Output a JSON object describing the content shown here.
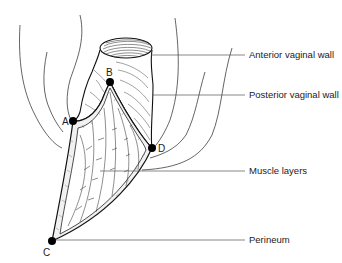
{
  "figure": {
    "type": "anatomical-diagram",
    "background": "#ffffff",
    "ink_color": "#111111",
    "leader_color": "#555555"
  },
  "labels": {
    "anterior": "Anterior vaginal wall",
    "posterior": "Posterior vaginal wall",
    "muscle": "Muscle layers",
    "perineum": "Perineum"
  },
  "points": {
    "a": "A",
    "b": "B",
    "c": "C",
    "d": "D"
  }
}
